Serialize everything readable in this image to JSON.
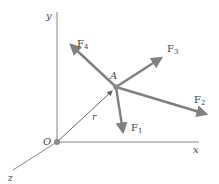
{
  "diagram": {
    "type": "force-vector-diagram",
    "axes": {
      "x_label": "x",
      "y_label": "y",
      "z_label": "z"
    },
    "origin_label": "O",
    "point_label": "A",
    "position_vector_label": "r",
    "forces": [
      {
        "name": "F1",
        "sub": "1"
      },
      {
        "name": "F2",
        "sub": "2"
      },
      {
        "name": "F3",
        "sub": "3"
      },
      {
        "name": "F4",
        "sub": "4"
      }
    ],
    "colors": {
      "axis": "#9a9a9a",
      "force": "#808080",
      "position_vector": "#666666",
      "point": "#8a8a8a",
      "text": "#444444"
    }
  }
}
